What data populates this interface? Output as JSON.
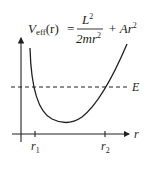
{
  "diagram": {
    "title_formula": {
      "lhs_symbol": "V",
      "lhs_subscript": "eff",
      "lhs_arg": "(r)",
      "equals": "=",
      "numerator": "L",
      "numerator_exp": "2",
      "denominator": "2mr",
      "denominator_exp": "2",
      "plus_term": "+ Ar",
      "plus_term_exp": "2"
    },
    "energy_label": "E",
    "x_axis_label": "r",
    "ticks": [
      {
        "label": "r",
        "subscript": "1"
      },
      {
        "label": "r",
        "subscript": "2"
      }
    ],
    "colors": {
      "ink": "#231f20",
      "background": "#ffffff"
    }
  }
}
